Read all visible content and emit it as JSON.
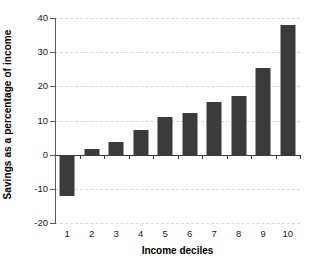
{
  "chart_data": {
    "type": "bar",
    "title": "",
    "subtitle": "",
    "xlabel": "Income deciles",
    "ylabel": "Savings as a percentage of income",
    "categories": [
      "1",
      "2",
      "3",
      "4",
      "5",
      "6",
      "7",
      "8",
      "9",
      "10"
    ],
    "values": [
      -12.0,
      1.7,
      3.8,
      7.3,
      11.0,
      12.3,
      15.4,
      17.3,
      25.4,
      38.0
    ],
    "ylim": [
      -20,
      40
    ],
    "yticks": [
      40,
      30,
      20,
      10,
      0,
      -10,
      -20
    ],
    "ytick_labels": [
      "40",
      "30",
      "20",
      "10",
      "0",
      "-10",
      "-20"
    ],
    "xtick_labels": [
      "1",
      "2",
      "3",
      "4",
      "5",
      "6",
      "7",
      "8",
      "9",
      "10"
    ],
    "grid": true,
    "grid_axis": "y",
    "legend": false,
    "legend_position": "none",
    "series": [
      {
        "name": "Savings rate",
        "values": [
          -12.0,
          1.7,
          3.8,
          7.3,
          11.0,
          12.3,
          15.4,
          17.3,
          25.4,
          38.0
        ]
      }
    ],
    "annotations": []
  },
  "style": {
    "bar_color": "#3b3b3b",
    "gridline_color": "#d9d9d9",
    "axis_color": "#5a5a5a",
    "zero_line_color": "#3a3a3a",
    "text_color": "#1a1a1a",
    "background": "#ffffff"
  }
}
